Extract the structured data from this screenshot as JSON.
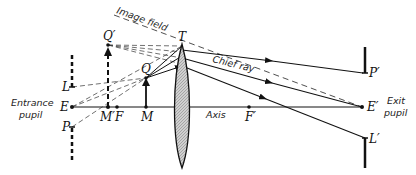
{
  "diagram": {
    "points": {
      "E": "E",
      "E_prime": "E′",
      "F": "F",
      "F_prime": "F′",
      "M": "M",
      "M_prime": "M′",
      "Q": "Q",
      "Q_prime": "Q′",
      "T": "T",
      "L": "L",
      "L_prime": "L′",
      "P": "P",
      "P_prime": "P′"
    },
    "annotations": {
      "image_field": "Image field",
      "chief_ray": "Chief ray",
      "axis": "Axis",
      "entrance_pupil_line1": "Entrance",
      "entrance_pupil_line2": "pupil",
      "exit_pupil_line1": "Exit",
      "exit_pupil_line2": "pupil"
    },
    "colors": {
      "ink": "#111111",
      "lens_fill": "#bdbdbd",
      "background": "#ffffff"
    }
  }
}
